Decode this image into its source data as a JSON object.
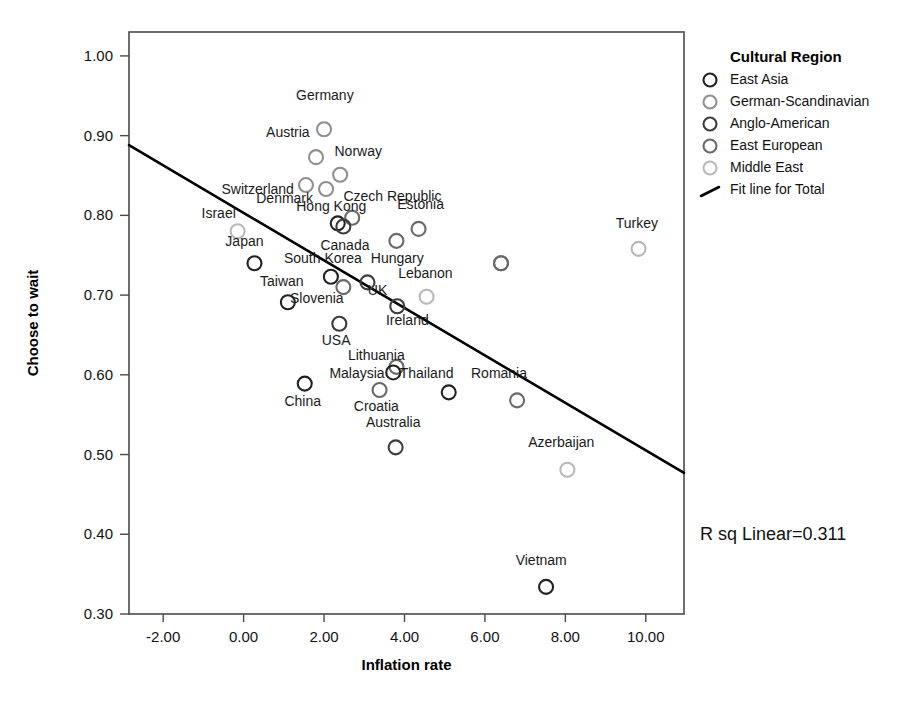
{
  "chart_data": {
    "type": "scatter",
    "title": "",
    "xlabel": "Inflation rate",
    "ylabel": "Choose to wait",
    "xlim": [
      -2.85,
      10.95
    ],
    "ylim": [
      0.3,
      1.03
    ],
    "xticks": [
      "-2.00",
      "0.00",
      "2.00",
      "4.00",
      "6.00",
      "8.00",
      "10.00"
    ],
    "xtick_values": [
      -2,
      0,
      2,
      4,
      6,
      8,
      10
    ],
    "yticks": [
      "0.30",
      "0.40",
      "0.50",
      "0.60",
      "0.70",
      "0.80",
      "0.90",
      "1.00"
    ],
    "ytick_values": [
      0.3,
      0.4,
      0.5,
      0.6,
      0.7,
      0.8,
      0.9,
      1.0
    ],
    "grid": false,
    "annotation": "R sq Linear=0.311",
    "r_squared": 0.311,
    "fit_line": {
      "name": "Fit line for Total",
      "x": [
        -2.85,
        10.95
      ],
      "y": [
        0.888,
        0.477
      ]
    },
    "legend": {
      "position": "right",
      "title": "Cultural Region",
      "entries": [
        {
          "label": "East Asia",
          "color": "#222222",
          "marker": "circle-open"
        },
        {
          "label": "German-Scandinavian",
          "color": "#8f8f8f",
          "marker": "circle-open"
        },
        {
          "label": "Anglo-American",
          "color": "#3d3d3d",
          "marker": "circle-open"
        },
        {
          "label": "East European",
          "color": "#6a6a6a",
          "marker": "circle-open"
        },
        {
          "label": "Middle East",
          "color": "#b9b9b9",
          "marker": "circle-open"
        },
        {
          "label": "Fit line for Total",
          "color": "#000000",
          "marker": "line"
        }
      ]
    },
    "points": [
      {
        "label": "Germany",
        "x": 2.0,
        "y": 0.908,
        "group": "German-Scandinavian",
        "color": "#8f8f8f",
        "lx": 2.02,
        "ly": 0.945,
        "anchor": "middle"
      },
      {
        "label": "Austria",
        "x": 1.8,
        "y": 0.873,
        "group": "German-Scandinavian",
        "color": "#8f8f8f",
        "lx": 1.1,
        "ly": 0.898,
        "anchor": "middle"
      },
      {
        "label": "Switzerland",
        "x": 1.55,
        "y": 0.838,
        "group": "German-Scandinavian",
        "color": "#8f8f8f",
        "lx": 0.35,
        "ly": 0.827,
        "anchor": "middle"
      },
      {
        "label": "Norway",
        "x": 2.4,
        "y": 0.851,
        "group": "German-Scandinavian",
        "color": "#8f8f8f",
        "lx": 2.85,
        "ly": 0.874,
        "anchor": "middle"
      },
      {
        "label": "Denmark",
        "x": 2.05,
        "y": 0.833,
        "group": "German-Scandinavian",
        "color": "#8f8f8f",
        "lx": 1.02,
        "ly": 0.816,
        "anchor": "middle"
      },
      {
        "label": "Czech Republic",
        "x": 2.7,
        "y": 0.797,
        "group": "East European",
        "color": "#6a6a6a",
        "lx": 3.7,
        "ly": 0.818,
        "anchor": "middle"
      },
      {
        "label": "Hong Kong",
        "x": 2.34,
        "y": 0.79,
        "group": "East Asia",
        "color": "#222222",
        "lx": 2.18,
        "ly": 0.805,
        "anchor": "middle"
      },
      {
        "label": "Canada",
        "x": 2.48,
        "y": 0.786,
        "group": "Anglo-American",
        "color": "#3d3d3d",
        "lx": 2.52,
        "ly": 0.757,
        "anchor": "middle"
      },
      {
        "label": "Estonia",
        "x": 4.35,
        "y": 0.783,
        "group": "East European",
        "color": "#6a6a6a",
        "lx": 4.4,
        "ly": 0.808,
        "anchor": "middle"
      },
      {
        "label": "Israel",
        "x": -0.15,
        "y": 0.78,
        "group": "Middle East",
        "color": "#b9b9b9",
        "lx": -0.62,
        "ly": 0.797,
        "anchor": "middle"
      },
      {
        "label": "Hungary",
        "x": 3.8,
        "y": 0.768,
        "group": "East European",
        "color": "#6a6a6a",
        "lx": 3.82,
        "ly": 0.74,
        "anchor": "middle"
      },
      {
        "label": "Japan",
        "x": 0.27,
        "y": 0.74,
        "group": "East Asia",
        "color": "#222222",
        "lx": 0.02,
        "ly": 0.762,
        "anchor": "middle"
      },
      {
        "label": "South Korea",
        "x": 2.17,
        "y": 0.723,
        "group": "East Asia",
        "color": "#222222",
        "lx": 1.97,
        "ly": 0.74,
        "anchor": "middle"
      },
      {
        "label": "Slovenia",
        "x": 2.48,
        "y": 0.71,
        "group": "East European",
        "color": "#6a6a6a",
        "lx": 1.82,
        "ly": 0.69,
        "anchor": "middle"
      },
      {
        "label": "UK",
        "x": 3.08,
        "y": 0.716,
        "group": "Anglo-American",
        "color": "#3d3d3d",
        "lx": 3.33,
        "ly": 0.7,
        "anchor": "middle"
      },
      {
        "label": "Lebanon",
        "x": 4.55,
        "y": 0.698,
        "group": "Middle East",
        "color": "#b9b9b9",
        "lx": 4.52,
        "ly": 0.722,
        "anchor": "middle"
      },
      {
        "label": "Taiwan",
        "x": 1.1,
        "y": 0.691,
        "group": "East Asia",
        "color": "#222222",
        "lx": 0.95,
        "ly": 0.712,
        "anchor": "middle"
      },
      {
        "label": "Ireland",
        "x": 3.82,
        "y": 0.686,
        "group": "Anglo-American",
        "color": "#3d3d3d",
        "lx": 4.07,
        "ly": 0.663,
        "anchor": "middle"
      },
      {
        "label": "USA",
        "x": 2.38,
        "y": 0.664,
        "group": "Anglo-American",
        "color": "#3d3d3d",
        "lx": 2.3,
        "ly": 0.638,
        "anchor": "middle"
      },
      {
        "label": "Lithuania",
        "x": 6.4,
        "y": 0.74,
        "group": "East European",
        "color": "#6a6a6a",
        "lx": 3.3,
        "ly": 0.618,
        "anchor": "middle"
      },
      {
        "label": "Malaysia",
        "x": 3.72,
        "y": 0.603,
        "group": "East Asia",
        "color": "#222222",
        "lx": 2.82,
        "ly": 0.596,
        "anchor": "middle"
      },
      {
        "label": "Thailand",
        "x": 5.1,
        "y": 0.578,
        "group": "East Asia",
        "color": "#222222",
        "lx": 4.55,
        "ly": 0.596,
        "anchor": "middle"
      },
      {
        "label": "Romania",
        "x": 6.8,
        "y": 0.568,
        "group": "East European",
        "color": "#6a6a6a",
        "lx": 6.35,
        "ly": 0.596,
        "anchor": "middle"
      },
      {
        "label": "China",
        "x": 1.52,
        "y": 0.589,
        "group": "East Asia",
        "color": "#222222",
        "lx": 1.47,
        "ly": 0.561,
        "anchor": "middle"
      },
      {
        "label": "Croatia",
        "x": 3.38,
        "y": 0.581,
        "group": "East European",
        "color": "#6a6a6a",
        "lx": 3.3,
        "ly": 0.554,
        "anchor": "middle"
      },
      {
        "label": "Australia",
        "x": 3.78,
        "y": 0.509,
        "group": "Anglo-American",
        "color": "#3d3d3d",
        "lx": 3.72,
        "ly": 0.535,
        "anchor": "middle"
      },
      {
        "label": "Azerbaijan",
        "x": 8.05,
        "y": 0.481,
        "group": "Middle East",
        "color": "#b9b9b9",
        "lx": 7.9,
        "ly": 0.51,
        "anchor": "middle"
      },
      {
        "label": "Turkey",
        "x": 9.82,
        "y": 0.758,
        "group": "Middle East",
        "color": "#b9b9b9",
        "lx": 9.78,
        "ly": 0.784,
        "anchor": "middle"
      },
      {
        "label": "Vietnam",
        "x": 7.52,
        "y": 0.334,
        "group": "East Asia",
        "color": "#222222",
        "lx": 7.4,
        "ly": 0.362,
        "anchor": "middle"
      }
    ],
    "extra_points": [
      {
        "label": "",
        "x": 6.4,
        "y": 0.74,
        "group": "East European",
        "color": "#6a6a6a"
      },
      {
        "label": "",
        "x": 3.8,
        "y": 0.61,
        "group": "East European",
        "color": "#6a6a6a"
      }
    ]
  }
}
